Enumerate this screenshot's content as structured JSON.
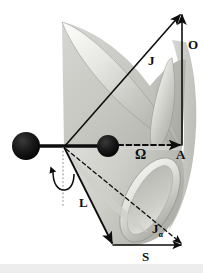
{
  "figure": {
    "background_color": "#ffffff",
    "bottom_band_color": "#ededed",
    "stroke_color": "#0d0d0d",
    "cone_fill_light": "#e8e8e4",
    "cone_fill_mid": "#c9c9c4",
    "cone_fill_dark": "#9f9f9a",
    "sphere_color": "#111111"
  },
  "labels": {
    "J": "J",
    "O": "O",
    "omega": "Ω",
    "A": "A",
    "L": "L",
    "J_alpha": "J",
    "J_alpha_sub": "α",
    "S": "S"
  },
  "geometry": {
    "apex": [
      64,
      147
    ],
    "point_A": [
      182,
      145
    ],
    "point_J_tip": [
      182,
      13
    ],
    "sphere_left": {
      "cx": 26,
      "cy": 146,
      "r": 14
    },
    "sphere_right": {
      "cx": 108,
      "cy": 146,
      "r": 11
    },
    "spin_axis_x": 63,
    "S_arrow": [
      [
        113,
        245
      ],
      [
        183,
        245
      ]
    ]
  },
  "vectors": [
    {
      "name": "J",
      "from": [
        64,
        147
      ],
      "to": [
        182,
        13
      ],
      "style": "solid"
    },
    {
      "name": "O",
      "from": [
        182,
        145
      ],
      "to": [
        182,
        13
      ],
      "style": "solid"
    },
    {
      "name": "omega",
      "from": [
        64,
        147
      ],
      "to": [
        182,
        145
      ],
      "style": "dashed"
    },
    {
      "name": "L",
      "from": [
        64,
        147
      ],
      "to": [
        113,
        245
      ],
      "style": "solid"
    },
    {
      "name": "J_alpha",
      "from": [
        64,
        147
      ],
      "to": [
        183,
        245
      ],
      "style": "dashed"
    },
    {
      "name": "S",
      "from": [
        113,
        245
      ],
      "to": [
        183,
        245
      ],
      "style": "solid"
    }
  ]
}
